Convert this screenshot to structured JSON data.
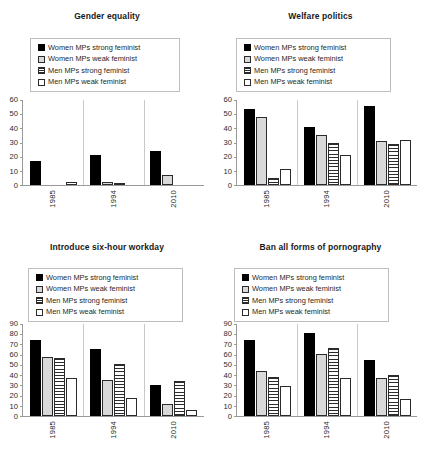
{
  "figure": {
    "background": "#ffffff",
    "series_colors": {
      "women_strong": "#000000",
      "women_weak": "#d9d9d9",
      "men_strong": "#ffffff",
      "men_weak": "#ffffff"
    },
    "legend_labels": [
      "Women MPs strong feminist",
      "Women MPs weak feminist",
      "Men MPs strong feminist",
      "Men MPs weak feminist"
    ],
    "legend_swatch_names": [
      "legend-swatch-black",
      "legend-swatch-gray",
      "legend-swatch-hatched",
      "legend-swatch-white"
    ]
  },
  "chart_data": [
    {
      "type": "bar",
      "title": "Gender equality",
      "xlabel": "",
      "ylabel": "",
      "categories": [
        "1985",
        "1994",
        "2010"
      ],
      "ylim": [
        0,
        60
      ],
      "yticks": [
        0,
        10,
        20,
        30,
        40,
        50,
        60
      ],
      "grid": false,
      "legend_position": "top",
      "series": [
        {
          "name": "Women MPs strong feminist",
          "values": [
            17,
            21,
            24
          ]
        },
        {
          "name": "Women MPs weak feminist",
          "values": [
            0,
            2,
            7
          ]
        },
        {
          "name": "Men MPs strong feminist",
          "values": [
            0,
            1,
            0
          ]
        },
        {
          "name": "Men MPs weak feminist",
          "values": [
            2,
            0,
            0
          ]
        }
      ]
    },
    {
      "type": "bar",
      "title": "Welfare politics",
      "xlabel": "",
      "ylabel": "",
      "categories": [
        "1985",
        "1994",
        "2010"
      ],
      "ylim": [
        0,
        60
      ],
      "yticks": [
        0,
        10,
        20,
        30,
        40,
        50,
        60
      ],
      "grid": false,
      "legend_position": "top",
      "series": [
        {
          "name": "Women MPs strong feminist",
          "values": [
            54,
            41,
            56
          ]
        },
        {
          "name": "Women MPs weak feminist",
          "values": [
            48,
            35,
            31
          ]
        },
        {
          "name": "Men MPs strong feminist",
          "values": [
            5,
            30,
            29
          ]
        },
        {
          "name": "Men MPs weak feminist",
          "values": [
            11,
            21,
            32
          ]
        }
      ]
    },
    {
      "type": "bar",
      "title": "Introduce six-hour workday",
      "xlabel": "",
      "ylabel": "",
      "categories": [
        "1985",
        "1994",
        "2010"
      ],
      "ylim": [
        0,
        90
      ],
      "yticks": [
        0,
        10,
        20,
        30,
        40,
        50,
        60,
        70,
        80,
        90
      ],
      "grid": false,
      "legend_position": "top",
      "series": [
        {
          "name": "Women MPs strong feminist",
          "values": [
            74,
            66,
            30
          ]
        },
        {
          "name": "Women MPs weak feminist",
          "values": [
            58,
            35,
            12
          ]
        },
        {
          "name": "Men MPs strong feminist",
          "values": [
            57,
            51,
            34
          ]
        },
        {
          "name": "Men MPs weak feminist",
          "values": [
            37,
            18,
            6
          ]
        }
      ]
    },
    {
      "type": "bar",
      "title": "Ban all forms of pornography",
      "xlabel": "",
      "ylabel": "",
      "categories": [
        "1985",
        "1994",
        "2010"
      ],
      "ylim": [
        0,
        90
      ],
      "yticks": [
        0,
        10,
        20,
        30,
        40,
        50,
        60,
        70,
        80,
        90
      ],
      "grid": false,
      "legend_position": "top",
      "series": [
        {
          "name": "Women MPs strong feminist",
          "values": [
            74,
            81,
            55
          ]
        },
        {
          "name": "Women MPs weak feminist",
          "values": [
            44,
            61,
            37
          ]
        },
        {
          "name": "Men MPs strong feminist",
          "values": [
            38,
            67,
            40
          ]
        },
        {
          "name": "Men MPs weak feminist",
          "values": [
            29,
            37,
            17
          ]
        }
      ]
    }
  ]
}
